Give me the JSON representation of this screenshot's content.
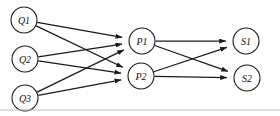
{
  "diagram": {
    "canvas": {
      "width": 280,
      "height": 116,
      "background": "#ffffff"
    },
    "style": {
      "node_fill": "#ffffff",
      "node_stroke": "#1a1a1a",
      "node_radius": 13,
      "edge_color": "#1a1a1a",
      "label_color": "#111111",
      "rule_color": "#b9b9b9"
    },
    "layers": [
      {
        "name": "queries",
        "node_ids": [
          "Q1",
          "Q2",
          "Q3"
        ]
      },
      {
        "name": "pages",
        "node_ids": [
          "P1",
          "P2"
        ]
      },
      {
        "name": "sites",
        "node_ids": [
          "S1",
          "S2"
        ]
      }
    ],
    "nodes": [
      {
        "id": "Q1",
        "label": "Q1",
        "cx": 24,
        "cy": 20,
        "r": 13
      },
      {
        "id": "Q2",
        "label": "Q2",
        "cx": 25,
        "cy": 59,
        "r": 13
      },
      {
        "id": "Q3",
        "label": "Q3",
        "cx": 25,
        "cy": 98,
        "r": 13
      },
      {
        "id": "P1",
        "label": "P1",
        "cx": 142,
        "cy": 41,
        "r": 13
      },
      {
        "id": "P2",
        "label": "P2",
        "cx": 141,
        "cy": 76,
        "r": 13
      },
      {
        "id": "S1",
        "label": "S1",
        "cx": 246,
        "cy": 41,
        "r": 13
      },
      {
        "id": "S2",
        "label": "S2",
        "cx": 247,
        "cy": 78,
        "r": 13
      }
    ],
    "edges": [
      {
        "from": "Q1",
        "to": "P1"
      },
      {
        "from": "Q1",
        "to": "P2"
      },
      {
        "from": "Q2",
        "to": "P1"
      },
      {
        "from": "Q2",
        "to": "P2"
      },
      {
        "from": "Q3",
        "to": "P1"
      },
      {
        "from": "Q3",
        "to": "P2"
      },
      {
        "from": "P1",
        "to": "S1"
      },
      {
        "from": "P1",
        "to": "S2"
      },
      {
        "from": "P2",
        "to": "S1"
      },
      {
        "from": "P2",
        "to": "S2"
      }
    ],
    "baseline_rule": {
      "x1": 0,
      "x2": 280,
      "y": 110
    }
  }
}
